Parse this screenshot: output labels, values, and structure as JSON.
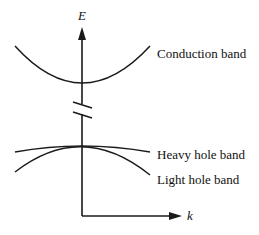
{
  "diagram": {
    "title": "",
    "axes": {
      "y_label": "E",
      "x_label": "k"
    },
    "bands": [
      {
        "name": "conduction",
        "label": "Conduction band"
      },
      {
        "name": "heavy-hole",
        "label": "Heavy hole band"
      },
      {
        "name": "light-hole",
        "label": "Light hole band"
      }
    ],
    "colors": {
      "line": "#1a1a1a",
      "background": "#ffffff"
    }
  }
}
